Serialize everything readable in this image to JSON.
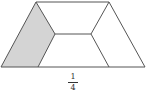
{
  "figure": {
    "shape": "trapezoid divided into four congruent trapezoids",
    "shaded_parts": 1,
    "total_parts": 4,
    "shade_color": "#d4d4d4",
    "line_color": "#555555"
  },
  "label": {
    "numerator": "1",
    "denominator": "4"
  }
}
